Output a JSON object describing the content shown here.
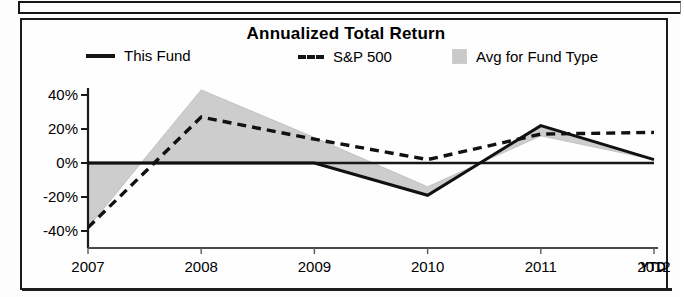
{
  "chart": {
    "title": "Annualized Total Return",
    "ytd_note": "YTD",
    "legend": [
      {
        "label": "This Fund",
        "icon": "solid-line-swatch",
        "color": "#151515"
      },
      {
        "label": "S&P 500",
        "icon": "dashed-line-swatch",
        "color": "#151515"
      },
      {
        "label": "Avg for Fund Type",
        "icon": "gray-band-swatch",
        "color": "#c9c9c9"
      }
    ]
  },
  "chart_data": {
    "type": "line",
    "title": "Annualized Total Return",
    "xlabel": "",
    "ylabel": "",
    "grid": false,
    "legend_position": "top",
    "categories": [
      "2007",
      "2008",
      "2009",
      "2010",
      "2011",
      "2012"
    ],
    "x_tick_labels": [
      "2007",
      "2008",
      "2009",
      "2010",
      "2011",
      "2012"
    ],
    "y_tick_labels": [
      "40%",
      "20%",
      "0%",
      "-20%",
      "-40%"
    ],
    "y_ticks": [
      40,
      20,
      0,
      -20,
      -40
    ],
    "ylim": [
      -48,
      48
    ],
    "series": [
      {
        "name": "This Fund",
        "style": "solid",
        "values": [
          0,
          0,
          0,
          -19,
          22,
          2
        ]
      },
      {
        "name": "S&P 500",
        "style": "dashed",
        "values": [
          -38,
          27,
          14,
          2,
          17,
          18
        ]
      },
      {
        "name": "Avg for Fund Type",
        "style": "band",
        "values": [
          -38,
          43,
          15,
          -14,
          16,
          2
        ]
      }
    ],
    "band_note": "Shaded gray region spans between the Avg for Fund Type series and the This Fund / zero reference line"
  }
}
